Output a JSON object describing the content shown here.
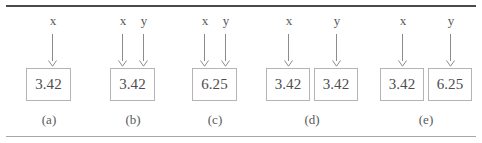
{
  "figure": {
    "background_color": "#ffffff",
    "rule_color_top": "#4a4a4a",
    "rule_color_bottom": "#a8a8a8",
    "box_border_color": "#b4b4b6",
    "arrow_color": "#8c8c8e",
    "text_color": "#4d4d4f"
  },
  "panels": [
    {
      "caption": "(a)",
      "labels": [
        {
          "text": "x"
        }
      ],
      "boxes": [
        {
          "value": "3.42"
        }
      ]
    },
    {
      "caption": "(b)",
      "labels": [
        {
          "text": "x"
        },
        {
          "text": "y"
        }
      ],
      "boxes": [
        {
          "value": "3.42"
        }
      ]
    },
    {
      "caption": "(c)",
      "labels": [
        {
          "text": "x"
        },
        {
          "text": "y"
        }
      ],
      "boxes": [
        {
          "value": "6.25"
        }
      ]
    },
    {
      "caption": "(d)",
      "labels": [
        {
          "text": "x"
        },
        {
          "text": "y"
        }
      ],
      "boxes": [
        {
          "value": "3.42"
        },
        {
          "value": "3.42"
        }
      ]
    },
    {
      "caption": "(e)",
      "labels": [
        {
          "text": "x"
        },
        {
          "text": "y"
        }
      ],
      "boxes": [
        {
          "value": "3.42"
        },
        {
          "value": "6.25"
        }
      ]
    }
  ]
}
